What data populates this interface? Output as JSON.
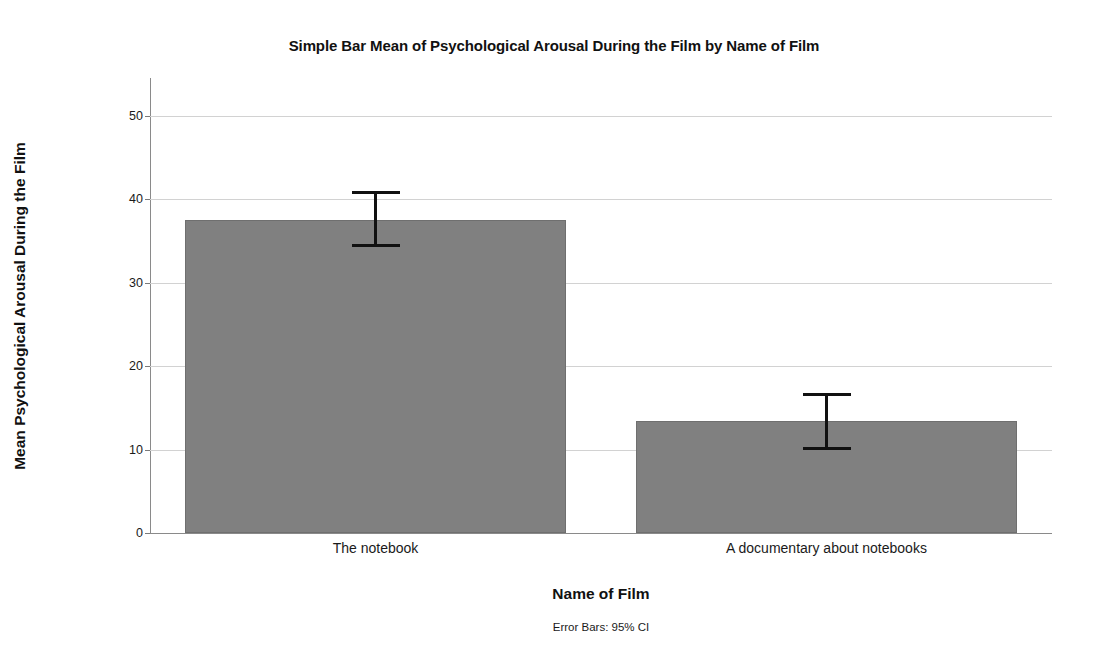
{
  "chart_data": {
    "type": "bar",
    "title": "Simple Bar Mean of Psychological Arousal During the Film by Name of Film",
    "xlabel": "Name of Film",
    "ylabel": "Mean Psychological Arousal During the Film",
    "categories": [
      "The notebook",
      "A documentary about notebooks"
    ],
    "values": [
      37.5,
      13.4
    ],
    "error_bars": {
      "type": "95% CI",
      "lower": [
        34.2,
        10.0
      ],
      "upper": [
        41.0,
        16.8
      ]
    },
    "ylim": [
      0,
      54.5
    ],
    "yticks": [
      0,
      10,
      20,
      30,
      40,
      50
    ],
    "ytick_labels": [
      "0",
      "10",
      "20",
      "30",
      "40",
      "50"
    ],
    "grid": true,
    "legend": false,
    "annotation": "Error Bars: 95% CI",
    "bar_color": "#808080",
    "bar_border_color": "#6f6f6f",
    "gridline_color": "#d2d2d2",
    "axis_color": "#8a8a8a",
    "errorbar_color": "#111111"
  }
}
